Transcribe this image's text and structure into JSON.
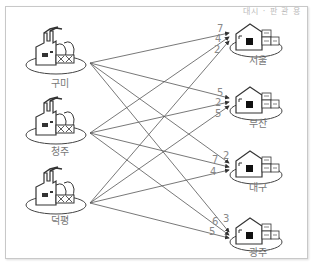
{
  "header": {
    "text": "대시 · 판 관 용"
  },
  "sources": [
    {
      "name": "구미",
      "x": 60,
      "y": 60,
      "ox": 90,
      "oy": 63
    },
    {
      "name": "청주",
      "x": 60,
      "y": 128,
      "ox": 90,
      "oy": 133
    },
    {
      "name": "덕평",
      "x": 60,
      "y": 196,
      "ox": 90,
      "oy": 203
    }
  ],
  "destinations": [
    {
      "name": "서울",
      "x": 258,
      "y": 40
    },
    {
      "name": "부산",
      "x": 258,
      "y": 103
    },
    {
      "name": "대구",
      "x": 258,
      "y": 166
    },
    {
      "name": "광주",
      "x": 258,
      "y": 232
    }
  ],
  "edges": [
    {
      "from": "구미",
      "to": "서울",
      "value": 7
    },
    {
      "from": "청주",
      "to": "서울",
      "value": 4
    },
    {
      "from": "덕평",
      "to": "서울",
      "value": 2
    },
    {
      "from": "구미",
      "to": "부산",
      "value": 5
    },
    {
      "from": "청주",
      "to": "부산",
      "value": 2
    },
    {
      "from": "덕평",
      "to": "부산",
      "value": 5
    },
    {
      "from": "구미",
      "to": "대구",
      "value": 7
    },
    {
      "from": "청주",
      "to": "대구",
      "value": 2
    },
    {
      "from": "덕평",
      "to": "대구",
      "value": 4
    },
    {
      "from": "구미",
      "to": "광주",
      "value": 6
    },
    {
      "from": "청주",
      "to": "광주",
      "value": 3
    },
    {
      "from": "덕평",
      "to": "광주",
      "value": 5
    }
  ],
  "edge_label_positions": [
    {
      "dest": "서울",
      "labels": [
        {
          "value": "7",
          "x": 217,
          "y": 32
        },
        {
          "value": "4",
          "x": 216,
          "y": 42
        },
        {
          "value": "2",
          "x": 216,
          "y": 53
        }
      ]
    },
    {
      "dest": "부산",
      "labels": [
        {
          "value": "5",
          "x": 217,
          "y": 96
        },
        {
          "value": "2",
          "x": 216,
          "y": 106
        },
        {
          "value": "5",
          "x": 216,
          "y": 117
        }
      ]
    },
    {
      "dest": "대구",
      "labels": [
        {
          "value": "7",
          "x": 212,
          "y": 162
        },
        {
          "value": "2",
          "x": 223,
          "y": 158
        },
        {
          "value": "4",
          "x": 211,
          "y": 174
        }
      ]
    },
    {
      "dest": "광주",
      "labels": [
        {
          "value": "6",
          "x": 212,
          "y": 224
        },
        {
          "value": "3",
          "x": 223,
          "y": 222
        },
        {
          "value": "5",
          "x": 210,
          "y": 234
        }
      ]
    }
  ],
  "colors": {
    "line": "#555555",
    "icon": "#444444",
    "label": "#777777",
    "frame": "#c8c8c8"
  }
}
